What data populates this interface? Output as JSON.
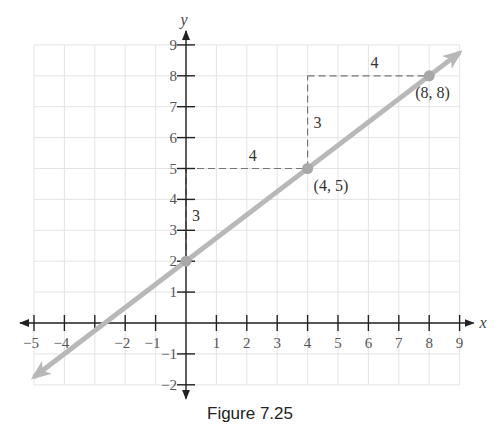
{
  "chart_data": {
    "type": "line",
    "title": "",
    "caption": "Figure 7.25",
    "xlabel": "x",
    "ylabel": "y",
    "xlim": [
      -5,
      9
    ],
    "ylim": [
      -2,
      9
    ],
    "grid": true,
    "x_ticks": [
      -5,
      -4,
      -2,
      -1,
      1,
      2,
      3,
      4,
      5,
      6,
      7,
      8,
      9
    ],
    "y_ticks": [
      -2,
      -1,
      1,
      2,
      3,
      4,
      5,
      6,
      7,
      8,
      9
    ],
    "x_tick_labels": [
      "−5",
      "−4",
      "−2",
      "−1",
      "1",
      "2",
      "3",
      "4",
      "5",
      "6",
      "7",
      "8",
      "9"
    ],
    "y_tick_labels": [
      "−2",
      "−1",
      "1",
      "2",
      "3",
      "4",
      "5",
      "6",
      "7",
      "8",
      "9"
    ],
    "series": [
      {
        "name": "line",
        "equation": "y = 3/4 x + 2",
        "x": [
          -5,
          9
        ],
        "y": [
          -1.75,
          8.75
        ],
        "color": "#b8b8b8",
        "arrows": "both"
      }
    ],
    "points": [
      {
        "x": 0,
        "y": 2,
        "label": ""
      },
      {
        "x": 4,
        "y": 5,
        "label": "(4, 5)"
      },
      {
        "x": 8,
        "y": 8,
        "label": "(8, 8)"
      }
    ],
    "annotations": [
      {
        "type": "rise",
        "from": [
          0,
          2
        ],
        "to": [
          0,
          5
        ],
        "label": "3"
      },
      {
        "type": "run",
        "from": [
          0,
          5
        ],
        "to": [
          4,
          5
        ],
        "label": "4"
      },
      {
        "type": "rise",
        "from": [
          4,
          5
        ],
        "to": [
          4,
          8
        ],
        "label": "3"
      },
      {
        "type": "run",
        "from": [
          4,
          8
        ],
        "to": [
          8,
          8
        ],
        "label": "4"
      }
    ]
  }
}
